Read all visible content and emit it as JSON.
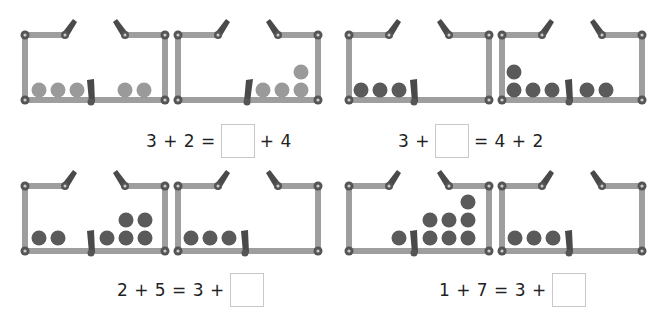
{
  "colors": {
    "frame": "#9e9e9e",
    "joint": "#555555",
    "lever": "#4a4a4a",
    "ball_light": "#9a9a9a",
    "ball_dark": "#5a5a5a"
  },
  "problems": [
    {
      "id": "p1",
      "equation_left": "3 + 2 =",
      "equation_right": "+ 4",
      "blank_position": "middle",
      "ball_shade": "light",
      "boxes": [
        {
          "left_count": 3,
          "right_count": 2
        },
        {
          "left_count": 0,
          "right_count": 4
        }
      ]
    },
    {
      "id": "p2",
      "equation_left": "3 +",
      "equation_right": "= 4 + 2",
      "blank_position": "middle",
      "ball_shade": "dark",
      "boxes": [
        {
          "left_count": 3,
          "right_count": 0
        },
        {
          "left_count": 4,
          "right_count": 2
        }
      ]
    },
    {
      "id": "p3",
      "equation_left": "2 + 5 = 3 +",
      "equation_right": "",
      "blank_position": "end",
      "ball_shade": "dark",
      "boxes": [
        {
          "left_count": 2,
          "right_count": 5
        },
        {
          "left_count": 3,
          "right_count": 0
        }
      ]
    },
    {
      "id": "p4",
      "equation_left": "1 + 7 = 3 +",
      "equation_right": "",
      "blank_position": "end",
      "ball_shade": "dark",
      "boxes": [
        {
          "left_count": 1,
          "right_count": 7
        },
        {
          "left_count": 3,
          "right_count": 0
        }
      ]
    }
  ]
}
